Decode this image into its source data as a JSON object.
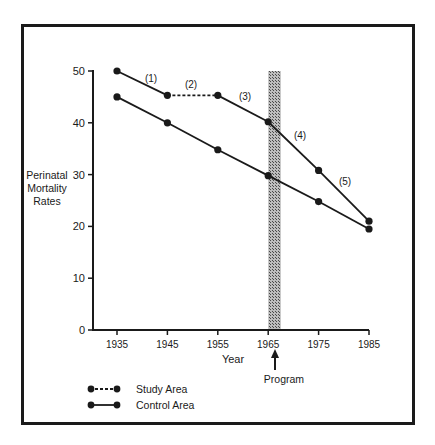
{
  "chart_data": {
    "type": "line",
    "title": "",
    "xlabel": "Year",
    "ylabel": "Perinatal Mortality Rates",
    "ylabel_lines": [
      "Perinatal",
      "Mortality",
      "Rates"
    ],
    "x": [
      1935,
      1945,
      1955,
      1965,
      1975,
      1985
    ],
    "x_tick_labels": [
      "1935",
      "1945",
      "1955",
      "1965",
      "1975",
      "1985"
    ],
    "y_ticks": [
      0,
      10,
      20,
      30,
      40,
      50
    ],
    "y_tick_labels": [
      "0",
      "10",
      "20",
      "30",
      "40",
      "50"
    ],
    "ylim": [
      0,
      50
    ],
    "grid": false,
    "series": [
      {
        "name": "Study Area",
        "values": [
          50,
          45.3,
          45.3,
          40.2,
          30.8,
          21
        ],
        "style": "solid with dashed segment (2)"
      },
      {
        "name": "Control Area",
        "values": [
          45,
          40,
          34.8,
          29.8,
          24.8,
          19.5
        ],
        "style": "solid"
      }
    ],
    "segment_labels": [
      "(1)",
      "(2)",
      "(3)",
      "(4)",
      "(5)"
    ],
    "shaded_band": {
      "from": 1965,
      "to": 1967.5,
      "label": "Program"
    },
    "annotation": "Program",
    "legend": {
      "position": "bottom-left",
      "entries": [
        "Study Area",
        "Control Area"
      ]
    }
  }
}
